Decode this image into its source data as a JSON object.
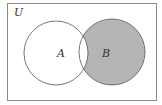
{
  "diagram": {
    "type": "venn",
    "universe_label": "U",
    "sets": [
      {
        "label": "A",
        "shaded": false
      },
      {
        "label": "B",
        "shaded": true
      }
    ],
    "shaded_region": "B minus A",
    "colors": {
      "outline": "#555555",
      "shade": "#b5b5b5",
      "background": "#ffffff"
    }
  }
}
